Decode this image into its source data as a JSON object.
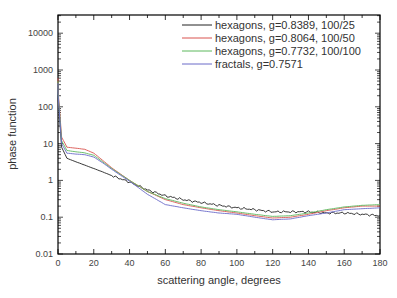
{
  "chart_data": {
    "type": "line",
    "title": "",
    "xlabel": "scattering angle, degrees",
    "ylabel": "phase function",
    "xlim": [
      0,
      180
    ],
    "ylim": [
      0.01,
      31600
    ],
    "yscale": "log",
    "xticks": [
      0,
      20,
      40,
      60,
      80,
      100,
      120,
      140,
      160,
      180
    ],
    "yticks": [
      {
        "value": 10000,
        "label": "10000"
      },
      {
        "value": 1000,
        "label": "1000"
      },
      {
        "value": 100,
        "label": "100"
      },
      {
        "value": 10,
        "label": "10"
      },
      {
        "value": 1,
        "label": "1"
      },
      {
        "value": 0.1,
        "label": "0.1"
      },
      {
        "value": 0.01,
        "label": "0.01"
      }
    ],
    "grid": false,
    "legend_position": "upper right",
    "x": [
      0,
      2,
      5,
      10,
      15,
      20,
      25,
      30,
      40,
      50,
      60,
      70,
      80,
      90,
      100,
      110,
      120,
      130,
      140,
      150,
      160,
      170,
      180
    ],
    "series": [
      {
        "name": "hexagons, g=0.8389, 100/25",
        "color": "#222222",
        "values": [
          200,
          8,
          4,
          3.2,
          2.6,
          2.1,
          1.7,
          1.35,
          0.9,
          0.55,
          0.38,
          0.3,
          0.25,
          0.21,
          0.18,
          0.16,
          0.14,
          0.14,
          0.14,
          0.13,
          0.13,
          0.12,
          0.11
        ]
      },
      {
        "name": "hexagons, g=0.8064, 100/50",
        "color": "#d9534f",
        "values": [
          300,
          15,
          8,
          7.5,
          7,
          5.5,
          3.5,
          2.2,
          1.0,
          0.5,
          0.3,
          0.22,
          0.18,
          0.15,
          0.13,
          0.11,
          0.095,
          0.1,
          0.12,
          0.15,
          0.18,
          0.2,
          0.2
        ]
      },
      {
        "name": "hexagons, g=0.7732, 100/100",
        "color": "#5cb85c",
        "values": [
          250,
          12,
          6.5,
          6,
          5.6,
          4.8,
          3.2,
          2.1,
          1.0,
          0.5,
          0.32,
          0.24,
          0.19,
          0.16,
          0.14,
          0.12,
          0.105,
          0.11,
          0.13,
          0.16,
          0.19,
          0.21,
          0.22
        ]
      },
      {
        "name": "fractals, g=0.7571",
        "color": "#6a6ac8",
        "values": [
          220,
          10,
          5.5,
          5.2,
          5,
          4.3,
          3.0,
          2.0,
          0.95,
          0.42,
          0.22,
          0.18,
          0.15,
          0.13,
          0.12,
          0.1,
          0.085,
          0.09,
          0.11,
          0.13,
          0.16,
          0.17,
          0.18
        ]
      }
    ]
  },
  "legend": {
    "items": [
      {
        "label": "hexagons, g=0.8389, 100/25",
        "color": "#222222"
      },
      {
        "label": "hexagons, g=0.8064, 100/50",
        "color": "#d9534f"
      },
      {
        "label": "hexagons, g=0.7732, 100/100",
        "color": "#5cb85c"
      },
      {
        "label": "fractals, g=0.7571",
        "color": "#6a6ac8"
      }
    ]
  }
}
